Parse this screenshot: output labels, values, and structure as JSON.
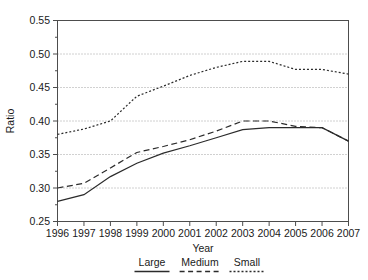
{
  "chart_data": {
    "type": "line",
    "title": "",
    "xlabel": "Year",
    "ylabel": "Ratio",
    "grid": true,
    "legend_position": "bottom",
    "x": [
      1996,
      1997,
      1998,
      1999,
      2000,
      2001,
      2002,
      2003,
      2004,
      2005,
      2006,
      2007
    ],
    "categories": [
      "1996",
      "1997",
      "1998",
      "1999",
      "2000",
      "2001",
      "2002",
      "2003",
      "2004",
      "2005",
      "2006",
      "2007"
    ],
    "xlim": [
      1996,
      2007
    ],
    "ylim": [
      0.25,
      0.55
    ],
    "yticks": [
      0.25,
      0.3,
      0.35,
      0.4,
      0.45,
      0.5,
      0.55
    ],
    "ytick_labels": [
      "0.25",
      "0.30",
      "0.35",
      "0.40",
      "0.45",
      "0.50",
      "0.55"
    ],
    "xtick_labels": [
      "1996",
      "1997",
      "1998",
      "1999",
      "2000",
      "2001",
      "2002",
      "2003",
      "2004",
      "2005",
      "2006",
      "2007"
    ],
    "series": [
      {
        "name": "Large",
        "style": "solid",
        "values": [
          0.28,
          0.29,
          0.317,
          0.337,
          0.352,
          0.363,
          0.375,
          0.387,
          0.39,
          0.39,
          0.39,
          0.37
        ]
      },
      {
        "name": "Medium",
        "style": "dashed",
        "values": [
          0.3,
          0.307,
          0.33,
          0.353,
          0.362,
          0.372,
          0.385,
          0.4,
          0.4,
          0.392,
          0.39,
          0.37
        ]
      },
      {
        "name": "Small",
        "style": "dotted",
        "values": [
          0.38,
          0.388,
          0.4,
          0.437,
          0.452,
          0.468,
          0.48,
          0.489,
          0.489,
          0.477,
          0.477,
          0.47
        ]
      }
    ]
  },
  "axes": {
    "y_label": "Ratio",
    "x_label": "Year"
  },
  "legend": {
    "items": [
      {
        "label": "Large",
        "style": "solid"
      },
      {
        "label": "Medium",
        "style": "dashed"
      },
      {
        "label": "Small",
        "style": "dotted"
      }
    ]
  }
}
